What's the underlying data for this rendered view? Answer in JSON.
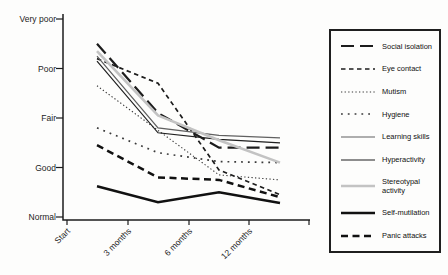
{
  "chart_data": {
    "type": "line",
    "title": "",
    "xlabel": "",
    "ylabel": "",
    "x_categories": [
      "Start",
      "3 months",
      "6 months",
      "12 months"
    ],
    "y_scale": {
      "labels": [
        "Very poor",
        "Poor",
        "Fair",
        "Good",
        "Normal"
      ],
      "values": [
        5,
        4,
        3,
        2,
        1
      ],
      "range": [
        1,
        5
      ]
    },
    "grid": false,
    "legend_position": "right",
    "series": [
      {
        "name": "Social isolation",
        "values": [
          4.5,
          3.1,
          2.4,
          2.4
        ],
        "style": {
          "color": "#1c1c1c",
          "width": 2.2,
          "dash": "13 6"
        }
      },
      {
        "name": "Eye contact",
        "values": [
          4.2,
          3.7,
          1.95,
          1.45
        ],
        "style": {
          "color": "#1c1c1c",
          "width": 1.7,
          "dash": "4.5 3.5"
        }
      },
      {
        "name": "Mutism",
        "values": [
          3.65,
          2.75,
          1.85,
          1.75
        ],
        "style": {
          "color": "#3a3a3a",
          "width": 1.1,
          "dash": "1.3 2.3"
        }
      },
      {
        "name": "Hygiene",
        "values": [
          2.8,
          2.3,
          2.12,
          2.1
        ],
        "style": {
          "color": "#3a3a3a",
          "width": 1.7,
          "dash": "1.8 5"
        }
      },
      {
        "name": "Learning skills",
        "values": [
          4.25,
          2.8,
          2.65,
          2.6
        ],
        "style": {
          "color": "#606060",
          "width": 1.2,
          "dash": ""
        }
      },
      {
        "name": "Hyperactivity",
        "values": [
          4.15,
          2.7,
          2.57,
          2.5
        ],
        "style": {
          "color": "#1f1f1f",
          "width": 1.2,
          "dash": ""
        }
      },
      {
        "name": "Stereotypal activity",
        "values": [
          4.35,
          3.05,
          2.55,
          2.1
        ],
        "style": {
          "color": "#c3c3c3",
          "width": 2.6,
          "dash": ""
        }
      },
      {
        "name": "Self-mutilation",
        "values": [
          1.62,
          1.3,
          1.5,
          1.28
        ],
        "style": {
          "color": "#111111",
          "width": 2.5,
          "dash": ""
        }
      },
      {
        "name": "Panic attacks",
        "values": [
          2.45,
          1.8,
          1.75,
          1.4
        ],
        "style": {
          "color": "#111111",
          "width": 2.5,
          "dash": "7 4.5"
        }
      }
    ]
  }
}
